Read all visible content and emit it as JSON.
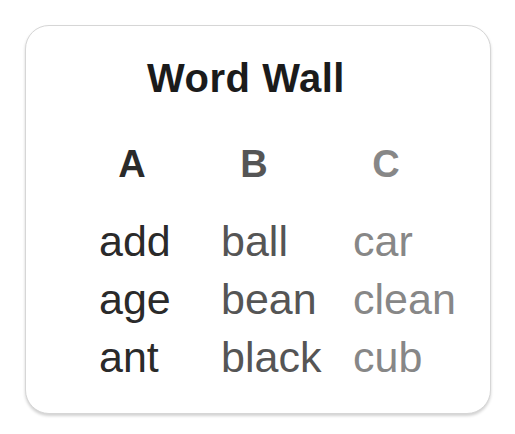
{
  "card": {
    "title": "Word Wall",
    "columns": [
      {
        "header": "A",
        "words": [
          "add",
          "age",
          "ant"
        ]
      },
      {
        "header": "B",
        "words": [
          "ball",
          "bean",
          "black"
        ]
      },
      {
        "header": "C",
        "words": [
          "car",
          "clean",
          "cub"
        ]
      }
    ],
    "colors": {
      "title": "#1b1b1b",
      "column_a_text": "#2a2a2a",
      "column_b_text": "#555555",
      "column_c_text": "#878787",
      "card_background": "#ffffff",
      "card_border": "#d6d6d6",
      "page_background": "#ffffff"
    }
  }
}
